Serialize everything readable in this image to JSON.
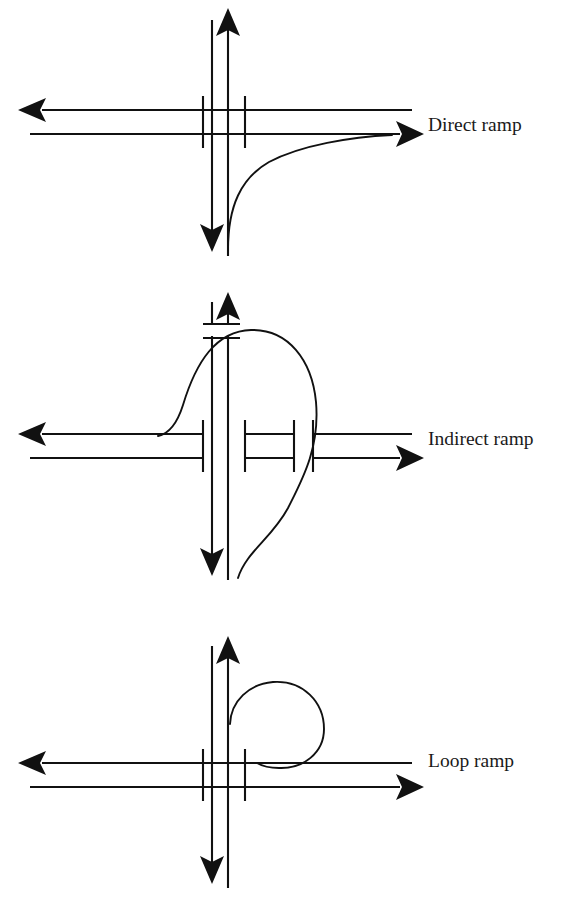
{
  "figure": {
    "background_color": "#ffffff",
    "line_color": "#111111",
    "label_color": "#1a1a1a"
  },
  "diagrams": [
    {
      "id": "direct-ramp",
      "label": "Direct ramp",
      "label_x": 428,
      "label_y": 127,
      "description": "Right-turn ramp curving directly from the southbound road onto the eastbound road",
      "ramp_path": "M 228 248 C 228 205, 240 178, 268 163 C 300 146, 350 137, 390 135",
      "arrows": [
        {
          "name": "west-arrow",
          "direction": "left",
          "x": 30,
          "y": 110
        },
        {
          "name": "east-arrow",
          "direction": "right",
          "x": 412,
          "y": 134
        },
        {
          "name": "north-arrow",
          "direction": "up",
          "x": 228,
          "y": 14
        },
        {
          "name": "south-arrow",
          "direction": "down",
          "x": 212,
          "y": 248
        }
      ],
      "vertical_road": {
        "left_x": 212,
        "right_x": 228,
        "top_y": 14,
        "bottom_y": 256
      },
      "horizontal_road": {
        "top_y": 110,
        "bottom_y": 134,
        "left_end": 30,
        "right_end": 412
      },
      "road_caps": [
        {
          "x": 203,
          "y1": 96,
          "y2": 148
        },
        {
          "x": 245,
          "y1": 96,
          "y2": 148
        }
      ]
    },
    {
      "id": "indirect-ramp",
      "label": "Indirect ramp",
      "label_x": 428,
      "label_y": 441,
      "description": "Left-turn ramp that loops up and over the mainline before descending to the southbound road",
      "ramp_path": "M 160 434 C 168 432, 176 424, 182 404 C 194 362, 215 336, 250 334 C 286 332, 310 360, 314 400 C 318 444, 302 478, 288 504 C 272 534, 248 552, 240 576",
      "arrows": [
        {
          "name": "west-arrow",
          "direction": "left",
          "x": 30,
          "y": 434
        },
        {
          "name": "east-arrow",
          "direction": "right",
          "x": 412,
          "y": 458
        },
        {
          "name": "north-arrow",
          "direction": "up",
          "x": 228,
          "y": 296
        },
        {
          "name": "south-arrow",
          "direction": "down",
          "x": 212,
          "y": 570
        }
      ],
      "vertical_road": {
        "left_x": 212,
        "right_x": 228,
        "top_y": 296,
        "bottom_y": 580
      },
      "horizontal_road": {
        "top_y": 434,
        "bottom_y": 458,
        "left_end": 30,
        "right_end": 412
      },
      "road_caps": [
        {
          "x": 203,
          "y1": 420,
          "y2": 472
        },
        {
          "x": 245,
          "y1": 420,
          "y2": 472
        },
        {
          "x": 294,
          "y1": 420,
          "y2": 472
        },
        {
          "x": 313,
          "y1": 420,
          "y2": 472
        },
        {
          "x": 203,
          "y1": 318,
          "y2": 330
        },
        {
          "x": 240,
          "y1": 318,
          "y2": 330
        }
      ]
    },
    {
      "id": "loop-ramp",
      "label": "Loop ramp",
      "label_x": 428,
      "label_y": 763,
      "description": "Loop ramp forming a full circle from the northbound road onto the eastbound road",
      "ramp_path": "M 230 722 C 232 700, 250 684, 272 682 C 302 680, 322 702, 322 728 C 322 752, 302 768, 278 768 C 268 768, 262 766, 258 763",
      "arrows": [
        {
          "name": "west-arrow",
          "direction": "left",
          "x": 30,
          "y": 763
        },
        {
          "name": "east-arrow",
          "direction": "right",
          "x": 412,
          "y": 787
        },
        {
          "name": "north-arrow",
          "direction": "up",
          "x": 228,
          "y": 640
        },
        {
          "name": "south-arrow",
          "direction": "down",
          "x": 212,
          "y": 880
        }
      ],
      "vertical_road": {
        "left_x": 212,
        "right_x": 228,
        "top_y": 640,
        "bottom_y": 888
      },
      "horizontal_road": {
        "top_y": 763,
        "bottom_y": 787,
        "left_end": 30,
        "right_end": 412
      },
      "road_caps": [
        {
          "x": 203,
          "y1": 749,
          "y2": 801
        },
        {
          "x": 245,
          "y1": 749,
          "y2": 801
        }
      ]
    }
  ]
}
